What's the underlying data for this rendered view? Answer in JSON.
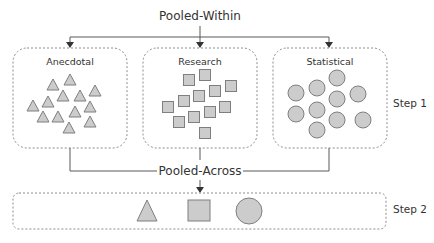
{
  "diagram": {
    "top_label": "Pooled-Within",
    "middle_label": "Pooled-Across",
    "colors": {
      "shape_fill": "#cccccc",
      "shape_stroke": "#7f7f7f",
      "line": "#595959",
      "dashed_border": "#8c8c8c",
      "text": "#333333"
    },
    "groups": [
      {
        "title": "Anecdotal",
        "shape": "triangle",
        "count": 13
      },
      {
        "title": "Research",
        "shape": "square",
        "count": 12
      },
      {
        "title": "Statistical",
        "shape": "circle",
        "count": 10
      }
    ],
    "step1_label": "Step 1",
    "step2_label": "Step 2",
    "step2_shapes": [
      "triangle",
      "square",
      "circle"
    ]
  }
}
